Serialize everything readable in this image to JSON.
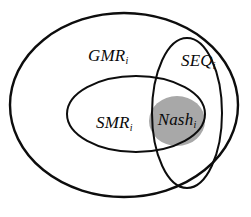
{
  "diagram": {
    "background_color": "#ffffff",
    "stroke_color": "#0d0d0d",
    "nash_fill_color": "#a8a8a8",
    "sets": [
      {
        "id": "gmr",
        "label": "GMR",
        "subscript": "i",
        "shape": "ellipse",
        "cx": 124,
        "cy": 105,
        "rx": 114,
        "ry": 92,
        "stroke_width": 2.4,
        "fill": "none",
        "label_x": 88,
        "label_y": 57
      },
      {
        "id": "smr",
        "label": "SMR",
        "subscript": "i",
        "shape": "ellipse",
        "cx": 136,
        "cy": 114,
        "rx": 69,
        "ry": 38,
        "stroke_width": 2.0,
        "fill": "none",
        "label_x": 96,
        "label_y": 124
      },
      {
        "id": "seq",
        "label": "SEQ",
        "subscript": "i",
        "shape": "ellipse",
        "cx": 187,
        "cy": 113,
        "rx": 35,
        "ry": 75,
        "stroke_width": 2.0,
        "fill": "none",
        "label_x": 181,
        "label_y": 62
      },
      {
        "id": "nash",
        "label": "Nash",
        "subscript": "i",
        "shape": "ellipse",
        "cx": 177,
        "cy": 121,
        "rx": 28,
        "ry": 25,
        "stroke_width": 0,
        "fill": "#a8a8a8",
        "label_x": 177,
        "label_y": 121
      }
    ]
  }
}
